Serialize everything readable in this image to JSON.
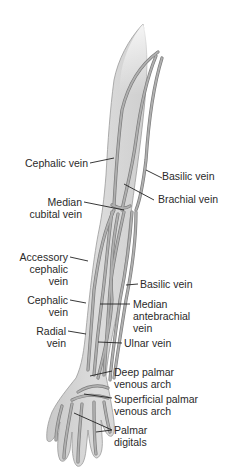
{
  "figure": {
    "colors": {
      "skin": "#d6d6d6",
      "skin_light": "#ececec",
      "outline": "#9a9a9a",
      "vein": "#a8a8a8",
      "vein_edge": "#7a7a7a",
      "leader": "#222222",
      "text": "#2a2a2a"
    }
  },
  "labels": {
    "cephalic_upper": [
      "Cephalic vein"
    ],
    "basilic_upper": [
      "Basilic vein"
    ],
    "brachial": [
      "Brachial vein"
    ],
    "median_cubital": [
      "Median",
      "cubital vein"
    ],
    "accessory_cephalic": [
      "Accessory",
      "cephalic",
      "vein"
    ],
    "basilic_lower": [
      "Basilic vein"
    ],
    "cephalic_lower": [
      "Cephalic",
      "vein"
    ],
    "median_antebrachial": [
      "Median",
      "antebrachial",
      "vein"
    ],
    "radial": [
      "Radial",
      "vein"
    ],
    "ulnar": [
      "Ulnar vein"
    ],
    "deep_palmar": [
      "Deep palmar",
      "venous arch"
    ],
    "superficial_palmar": [
      "Superficial palmar",
      "venous arch"
    ],
    "palmar_digitals": [
      "Palmar",
      "digitals"
    ]
  }
}
